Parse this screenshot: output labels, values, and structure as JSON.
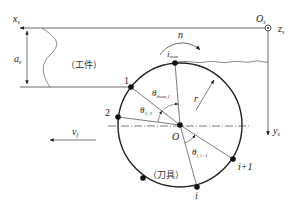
{
  "diagram": {
    "type": "milling-cutter-workpiece-geometry",
    "labels": {
      "x_axis": "x",
      "x_axis_sub": "s",
      "z_axis": "z",
      "z_axis_sub": "s",
      "y_axis": "y",
      "y_axis_sub": "s",
      "origin_s": "O",
      "origin_s_sub": "s",
      "depth": "a",
      "depth_sub": "e",
      "workpiece": "（工件）",
      "tool": "（刀具）",
      "rotation": "n",
      "i_max": "i",
      "i_max_sub": "max",
      "radius": "r",
      "center": "O",
      "feed": "v",
      "feed_sub": "f",
      "theta_max1": "θ",
      "theta_max1_sub": "imax,1",
      "theta_12": "θ",
      "theta_12_sub": "1, 2",
      "theta_ii1": "θ",
      "theta_ii1_sub": "i, i+1"
    },
    "points": [
      {
        "label": "1"
      },
      {
        "label": "2"
      },
      {
        "label": "i"
      },
      {
        "label": "i+1"
      }
    ],
    "colors": {
      "line": "#222222",
      "thin": "#555555"
    }
  }
}
